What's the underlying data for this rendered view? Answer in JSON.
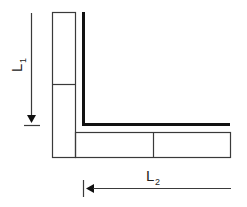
{
  "diagram": {
    "type": "corner-joint-dimension-sketch",
    "colors": {
      "stroke": "#3a3a3a",
      "thick": "#111111",
      "background": "#ffffff"
    },
    "labels": {
      "l1": {
        "main": "L",
        "sub": "1"
      },
      "l2": {
        "main": "L",
        "sub": "2"
      }
    },
    "elements": {
      "vertical_member": "vertical rectangular member split into two segments",
      "horizontal_member": "horizontal rectangular member split into two segments",
      "inner_corner": "thick L-shaped inner edge"
    }
  }
}
